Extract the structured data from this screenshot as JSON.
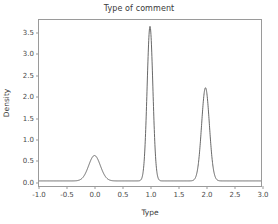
{
  "chart_data": {
    "type": "line",
    "title": "Type of comment",
    "xlabel": "Type",
    "ylabel": "Density",
    "xlim": [
      -1.0,
      3.0
    ],
    "ylim": [
      -0.12,
      3.8
    ],
    "grid": false,
    "legend": null,
    "xticks": [
      "-1.0",
      "-0.5",
      "0.0",
      "0.5",
      "1.0",
      "1.5",
      "2.0",
      "2.5",
      "3.0"
    ],
    "xtick_values": [
      -1.0,
      -0.5,
      0.0,
      0.5,
      1.0,
      1.5,
      2.0,
      2.5,
      3.0
    ],
    "yticks": [
      "0.0",
      "0.5",
      "1.0",
      "1.5",
      "2.0",
      "2.5",
      "3.0",
      "3.5"
    ],
    "ytick_values": [
      0.0,
      0.5,
      1.0,
      1.5,
      2.0,
      2.5,
      3.0,
      3.5
    ],
    "line_color": "#555555",
    "series": [
      {
        "name": "Density",
        "peaks": [
          {
            "center": 0.0,
            "height": 0.6,
            "sigma": 0.105
          },
          {
            "center": 1.0,
            "height": 3.65,
            "sigma": 0.052
          },
          {
            "center": 2.0,
            "height": 2.2,
            "sigma": 0.07
          }
        ]
      }
    ]
  }
}
